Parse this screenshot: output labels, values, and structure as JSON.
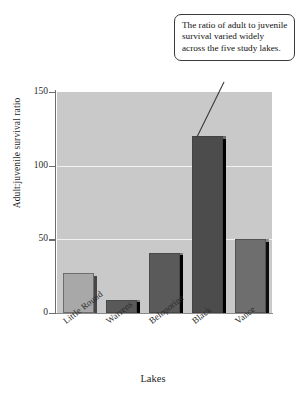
{
  "chart_data": {
    "type": "bar",
    "title": "",
    "subtitle": "",
    "xlabel": "Lakes",
    "ylabel": "Adult:juvenile survival ratio",
    "categories": [
      "Little Round",
      "Warrens",
      "Beloporine",
      "Black",
      "Vance"
    ],
    "values": [
      27,
      9,
      41,
      120,
      50
    ],
    "series": [
      {
        "name": "Adult:juvenile survival ratio",
        "values": [
          27,
          9,
          41,
          120,
          50
        ]
      }
    ],
    "bar_colors": [
      "#a8a8a8",
      "#595959",
      "#5a5a5a",
      "#4c4c4c",
      "#6e6e6e"
    ],
    "ylim": [
      0,
      150
    ],
    "yticks": [
      0,
      50,
      100,
      150
    ],
    "ytick_labels": [
      "0",
      "50",
      "100",
      "150"
    ],
    "grid": true,
    "gridline_values": [
      50,
      100
    ],
    "legend": "none",
    "plot_background": "#c9c9c9",
    "gridline_color": "#f2f2f2",
    "annotations": [
      {
        "text": "The ratio of adult to juvenile survival varied widely across the five study lakes.",
        "points_to": "Black"
      }
    ]
  },
  "callout": {
    "text": "The ratio of adult to juvenile survival varied widely across the five study lakes."
  }
}
